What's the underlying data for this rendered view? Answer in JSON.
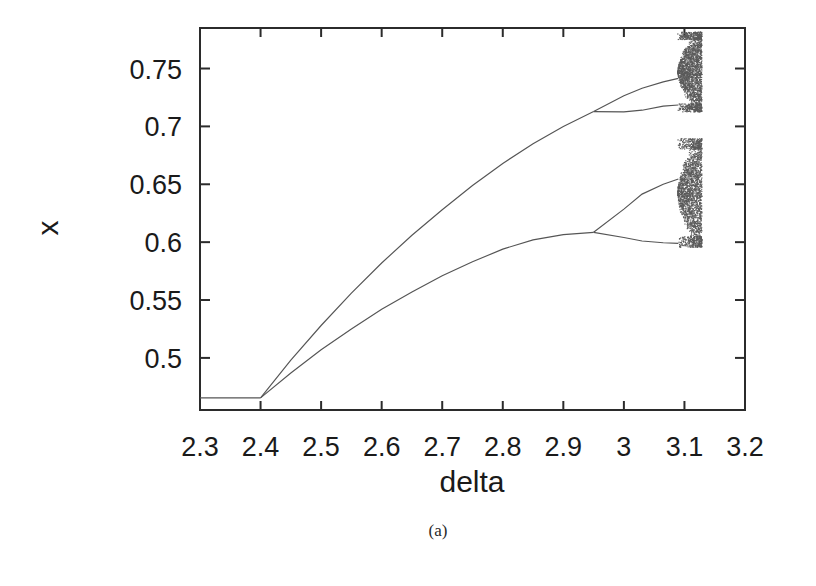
{
  "figure": {
    "caption": "(a)",
    "background": "#ffffff",
    "ink_color": "#2b2b2b",
    "curve_color": "#555555"
  },
  "chart_data": {
    "type": "line",
    "subtype": "bifurcation-diagram",
    "title": "",
    "xlabel": "delta",
    "ylabel": "x",
    "xlim": [
      2.3,
      3.2
    ],
    "ylim": [
      0.455,
      0.785
    ],
    "grid": false,
    "legend": null,
    "x_ticks": [
      2.3,
      2.4,
      2.5,
      2.6,
      2.7,
      2.8,
      2.9,
      3,
      3.1,
      3.2
    ],
    "x_tick_labels": [
      "2.3",
      "2.4",
      "2.5",
      "2.6",
      "2.7",
      "2.8",
      "2.9",
      "3",
      "3.1",
      "3.2"
    ],
    "y_ticks": [
      0.5,
      0.55,
      0.6,
      0.65,
      0.7,
      0.75
    ],
    "y_tick_labels": [
      "0.5",
      "0.55",
      "0.6",
      "0.65",
      "0.7",
      "0.75"
    ],
    "bifurcation_points": [
      {
        "name": "period-1-to-2",
        "delta": 2.4,
        "x": 0.465
      },
      {
        "name": "period-2-to-4-upper",
        "delta": 2.95,
        "x": 0.713
      },
      {
        "name": "period-2-to-4-lower",
        "delta": 2.95,
        "x": 0.608
      },
      {
        "name": "period-4-to-8-upper",
        "delta": 3.065,
        "x": 0.738
      },
      {
        "name": "period-4-to-8-lower",
        "delta": 3.065,
        "x": 0.65
      },
      {
        "name": "chaos-onset",
        "delta": 3.09,
        "x": null
      }
    ],
    "series": [
      {
        "name": "fixed-point",
        "points": [
          [
            2.3,
            0.4655
          ],
          [
            2.35,
            0.4655
          ],
          [
            2.4,
            0.4655
          ]
        ]
      },
      {
        "name": "upper-branch",
        "points": [
          [
            2.4,
            0.4655
          ],
          [
            2.45,
            0.498
          ],
          [
            2.5,
            0.528
          ],
          [
            2.55,
            0.556
          ],
          [
            2.6,
            0.582
          ],
          [
            2.65,
            0.606
          ],
          [
            2.7,
            0.628
          ],
          [
            2.75,
            0.649
          ],
          [
            2.8,
            0.668
          ],
          [
            2.85,
            0.685
          ],
          [
            2.9,
            0.7
          ],
          [
            2.95,
            0.7128
          ]
        ]
      },
      {
        "name": "lower-branch",
        "points": [
          [
            2.4,
            0.4655
          ],
          [
            2.45,
            0.487
          ],
          [
            2.5,
            0.507
          ],
          [
            2.55,
            0.525
          ],
          [
            2.6,
            0.542
          ],
          [
            2.65,
            0.557
          ],
          [
            2.7,
            0.571
          ],
          [
            2.75,
            0.583
          ],
          [
            2.8,
            0.594
          ],
          [
            2.85,
            0.602
          ],
          [
            2.9,
            0.6065
          ],
          [
            2.95,
            0.6085
          ]
        ]
      },
      {
        "name": "upper-branch-split-high",
        "points": [
          [
            2.95,
            0.7128
          ],
          [
            3.0,
            0.7265
          ],
          [
            3.03,
            0.733
          ],
          [
            3.065,
            0.7385
          ],
          [
            3.09,
            0.7415
          ]
        ]
      },
      {
        "name": "upper-branch-split-low",
        "points": [
          [
            2.95,
            0.7128
          ],
          [
            3.0,
            0.7125
          ],
          [
            3.03,
            0.714
          ],
          [
            3.065,
            0.7175
          ],
          [
            3.09,
            0.7185
          ]
        ]
      },
      {
        "name": "lower-branch-split-high",
        "points": [
          [
            2.95,
            0.6085
          ],
          [
            3.0,
            0.6285
          ],
          [
            3.03,
            0.6415
          ],
          [
            3.065,
            0.65
          ],
          [
            3.09,
            0.6545
          ]
        ]
      },
      {
        "name": "lower-branch-split-low",
        "points": [
          [
            2.95,
            0.6085
          ],
          [
            3.0,
            0.604
          ],
          [
            3.03,
            0.601
          ],
          [
            3.065,
            0.5995
          ],
          [
            3.09,
            0.599
          ]
        ]
      }
    ],
    "chaotic_bands": [
      {
        "name": "upper-chaos",
        "delta_range": [
          3.088,
          3.128
        ],
        "x_range": [
          0.713,
          0.782
        ]
      },
      {
        "name": "lower-chaos",
        "delta_range": [
          3.088,
          3.128
        ],
        "x_range": [
          0.596,
          0.69
        ]
      }
    ]
  }
}
